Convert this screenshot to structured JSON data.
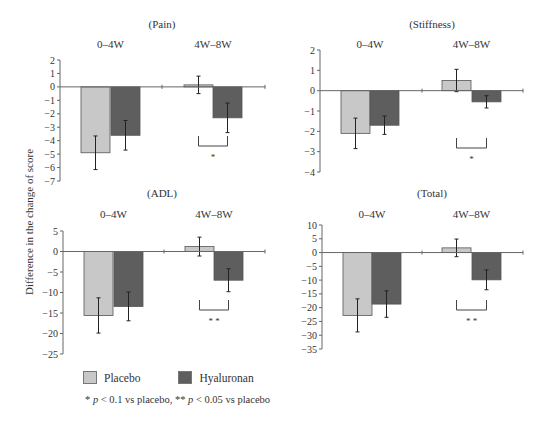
{
  "y_axis_label": "Difference in the change of score",
  "legend": {
    "items": [
      {
        "label": "Placebo",
        "color": "#c8c8c8"
      },
      {
        "label": "Hyaluronan",
        "color": "#5e5e5e"
      }
    ]
  },
  "footnote": {
    "star1": "*",
    "p1": "p",
    "t1": " < 0.1 vs placebo, ",
    "star2": "**",
    "p2": "p",
    "t2": " < 0.05 vs placebo"
  },
  "chart_data": [
    {
      "type": "bar",
      "title": "(Pain)",
      "categories": [
        "0–4W",
        "4W–8W"
      ],
      "series": [
        {
          "name": "Placebo",
          "values": [
            -4.9,
            0.15
          ],
          "error": [
            1.25,
            0.65
          ]
        },
        {
          "name": "Hyaluronan",
          "values": [
            -3.6,
            -2.3
          ],
          "error": [
            1.1,
            1.1
          ]
        }
      ],
      "ylim": [
        -7,
        2
      ],
      "yticks": [
        2,
        1,
        0,
        -1,
        -2,
        -3,
        -4,
        -5,
        -6,
        -7
      ],
      "significance": [
        {
          "category": "4W–8W",
          "label": "*"
        }
      ]
    },
    {
      "type": "bar",
      "title": "(Stiffness)",
      "categories": [
        "0–4W",
        "4W–8W"
      ],
      "series": [
        {
          "name": "Placebo",
          "values": [
            -2.1,
            0.5
          ],
          "error": [
            0.75,
            0.55
          ]
        },
        {
          "name": "Hyaluronan",
          "values": [
            -1.7,
            -0.55
          ],
          "error": [
            0.45,
            0.3
          ]
        }
      ],
      "ylim": [
        -4,
        2
      ],
      "yticks": [
        2,
        1,
        0,
        -1,
        -2,
        -3,
        -4
      ],
      "significance": [
        {
          "category": "4W–8W",
          "label": "*"
        }
      ]
    },
    {
      "type": "bar",
      "title": "(ADL)",
      "categories": [
        "0–4W",
        "4W–8W"
      ],
      "series": [
        {
          "name": "Placebo",
          "values": [
            -15.6,
            1.2
          ],
          "error": [
            4.3,
            2.3
          ]
        },
        {
          "name": "Hyaluronan",
          "values": [
            -13.4,
            -7.0
          ],
          "error": [
            3.5,
            2.8
          ]
        }
      ],
      "ylim": [
        -25,
        5
      ],
      "yticks": [
        5,
        0,
        -5,
        -10,
        -15,
        -20,
        -25
      ],
      "significance": [
        {
          "category": "4W–8W",
          "label": "* *"
        }
      ]
    },
    {
      "type": "bar",
      "title": "(Total)",
      "categories": [
        "0–4W",
        "4W–8W"
      ],
      "series": [
        {
          "name": "Placebo",
          "values": [
            -22.8,
            1.7
          ],
          "error": [
            6.0,
            3.2
          ]
        },
        {
          "name": "Hyaluronan",
          "values": [
            -18.7,
            -9.9
          ],
          "error": [
            4.8,
            3.6
          ]
        }
      ],
      "ylim": [
        -35,
        10
      ],
      "yticks": [
        10,
        5,
        0,
        -5,
        -10,
        -15,
        -20,
        -25,
        -30,
        -35
      ],
      "significance": [
        {
          "category": "4W–8W",
          "label": "* *"
        }
      ]
    }
  ]
}
